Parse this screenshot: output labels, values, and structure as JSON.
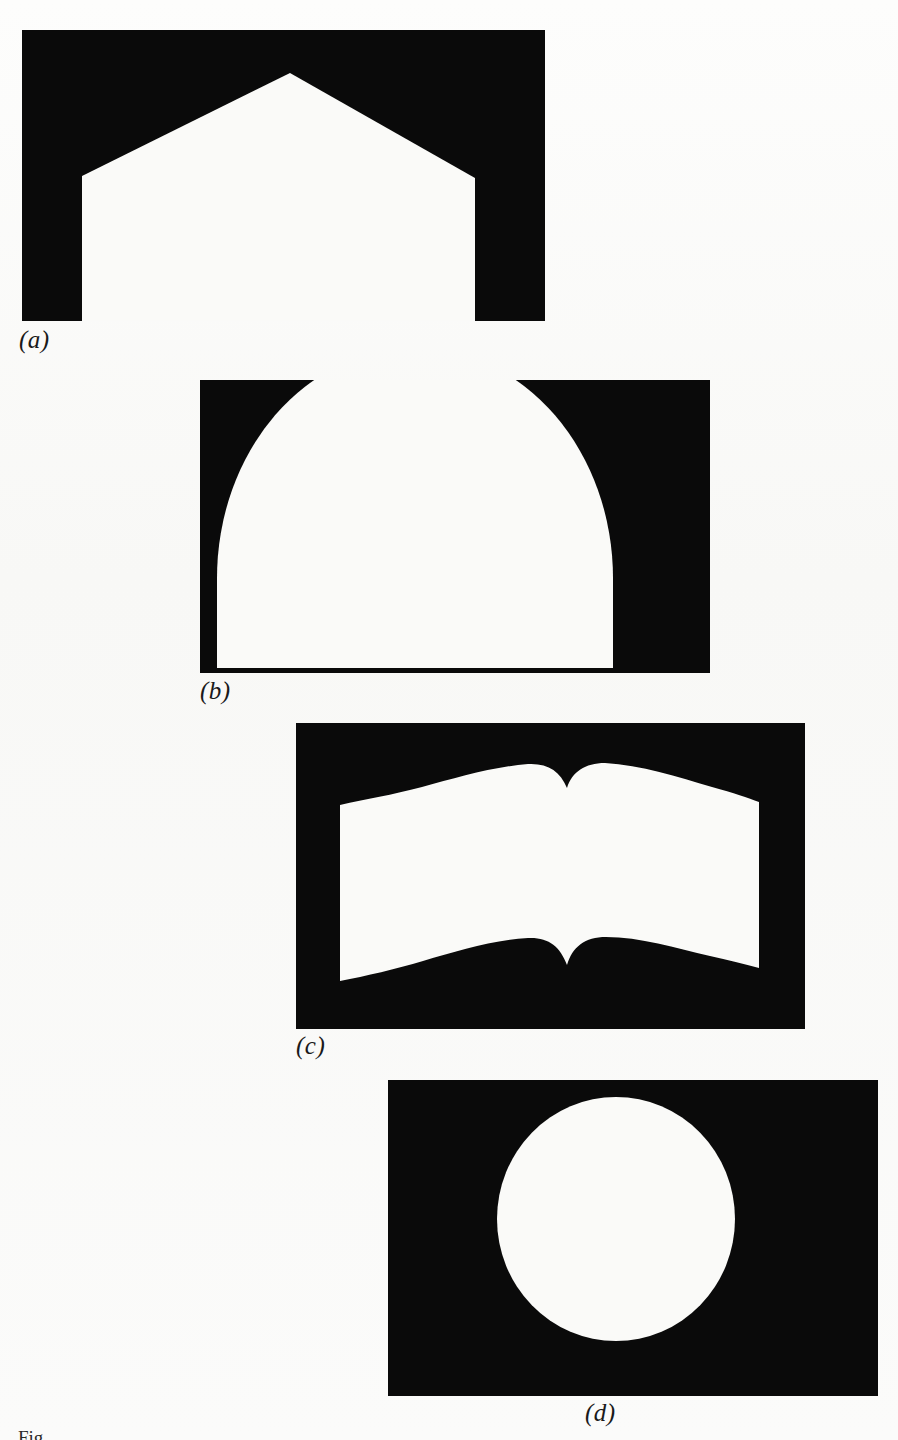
{
  "figure": {
    "kind": "binary-silhouette-plate",
    "background_color": "#fbfbf9",
    "ink_color": "#0a0a0a",
    "field_color": "#fafaf8",
    "cut_off_label": "Fig.",
    "panels": [
      {
        "id": "a",
        "caption": "(a)",
        "shape_name": "house-pentagon",
        "polarity": "white shape on black rectangle",
        "frame": {
          "x": 22,
          "y": 30,
          "w": 523,
          "h": 291
        },
        "shape_points": "60,146 268,43 453,148 453,291 60,291"
      },
      {
        "id": "b",
        "caption": "(b)",
        "shape_name": "semicircular-dome",
        "polarity": "white shape on black rectangle",
        "frame": {
          "x": 200,
          "y": 380,
          "w": 510,
          "h": 293
        },
        "dome_center_x": 215,
        "dome_radius_x": 198,
        "dome_radius_y": 230,
        "baseline_y": 288
      },
      {
        "id": "c",
        "caption": "(c)",
        "shape_name": "open-book",
        "polarity": "white shape on black rectangle",
        "frame": {
          "x": 296,
          "y": 723,
          "w": 509,
          "h": 306
        },
        "border_left": 44,
        "border_right": 463,
        "border_top": 26,
        "border_bottom": 281
      },
      {
        "id": "d",
        "caption": "(d)",
        "shape_name": "circle-disc",
        "polarity": "white shape on black rectangle",
        "frame": {
          "x": 388,
          "y": 1080,
          "w": 490,
          "h": 316
        },
        "circle_cx": 228,
        "circle_cy": 139,
        "circle_r": 119
      }
    ]
  }
}
